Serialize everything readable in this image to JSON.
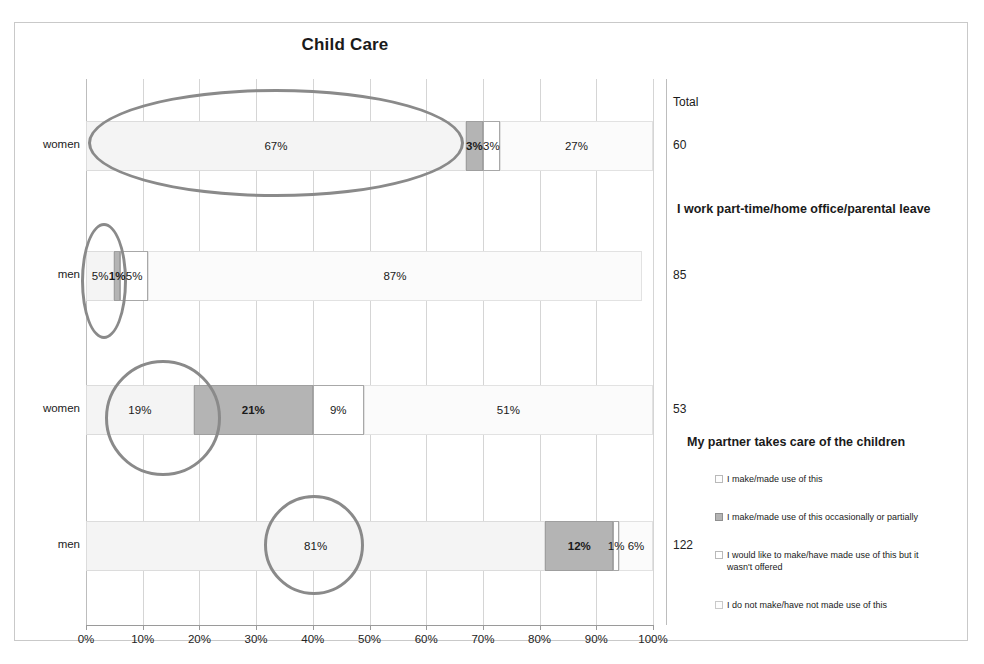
{
  "chart_data": {
    "type": "bar",
    "subtype": "100% stacked horizontal bar",
    "title": "Child Care",
    "xlabel": "",
    "ylabel": "",
    "xlim": [
      0,
      100
    ],
    "xticks": [
      "0%",
      "10%",
      "20%",
      "30%",
      "40%",
      "50%",
      "60%",
      "70%",
      "80%",
      "90%",
      "100%"
    ],
    "grid": true,
    "legend_position": "right",
    "total_header": "Total",
    "series": [
      {
        "name": "I make/made use of this",
        "key": "s0"
      },
      {
        "name": "I make/made use of this occasionally or partially",
        "key": "s1"
      },
      {
        "name": "I would like to make/have made use of this but it wasn't offered",
        "key": "s2"
      },
      {
        "name": "I do not make/have not made use of this",
        "key": "s3"
      }
    ],
    "groups": [
      {
        "title": "I work part-time/home office/parental leave",
        "bars": [
          {
            "category": "women",
            "total": "60",
            "values": [
              67,
              3,
              3,
              27
            ],
            "labels": [
              "67%",
              "3%",
              "3%",
              "27%"
            ]
          },
          {
            "category": "men",
            "total": "85",
            "values": [
              5,
              1,
              5,
              87
            ],
            "labels": [
              "5%",
              "1%",
              "5%",
              "87%"
            ]
          }
        ]
      },
      {
        "title": "My partner takes care of the children",
        "bars": [
          {
            "category": "women",
            "total": "53",
            "values": [
              19,
              21,
              9,
              51
            ],
            "labels": [
              "19%",
              "21%",
              "9%",
              "51%"
            ]
          },
          {
            "category": "men",
            "total": "122",
            "values": [
              81,
              12,
              1,
              6
            ],
            "labels": [
              "81%",
              "12%",
              "1%",
              "6%"
            ]
          }
        ]
      }
    ],
    "annotations": [
      {
        "shape": "ellipse",
        "target": "women-part-time-67pct"
      },
      {
        "shape": "ellipse",
        "target": "men-part-time-5pct"
      },
      {
        "shape": "ellipse",
        "target": "women-partner-19pct"
      },
      {
        "shape": "ellipse",
        "target": "men-partner-81pct"
      }
    ],
    "colors": {
      "series0": "#f4f4f4",
      "series1": "#b4b4b4",
      "series2": "#ffffff",
      "series3": "#fbfbfb",
      "annotation": "#8a8a8a",
      "grid": "#d5d5d5"
    }
  }
}
